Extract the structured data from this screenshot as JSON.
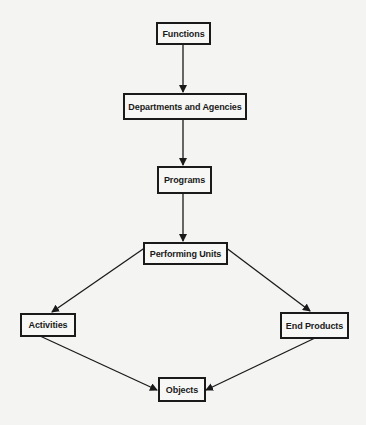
{
  "diagram": {
    "type": "flowchart",
    "nodes": [
      {
        "id": "functions",
        "label": "Functions"
      },
      {
        "id": "departments",
        "label": "Departments and Agencies"
      },
      {
        "id": "programs",
        "label": "Programs"
      },
      {
        "id": "performing_units",
        "label": "Performing Units"
      },
      {
        "id": "activities",
        "label": "Activities"
      },
      {
        "id": "end_products",
        "label": "End Products"
      },
      {
        "id": "objects",
        "label": "Objects"
      }
    ],
    "edges": [
      {
        "from": "functions",
        "to": "departments"
      },
      {
        "from": "departments",
        "to": "programs"
      },
      {
        "from": "programs",
        "to": "performing_units"
      },
      {
        "from": "performing_units",
        "to": "activities"
      },
      {
        "from": "performing_units",
        "to": "end_products"
      },
      {
        "from": "activities",
        "to": "objects"
      },
      {
        "from": "end_products",
        "to": "objects"
      }
    ]
  }
}
